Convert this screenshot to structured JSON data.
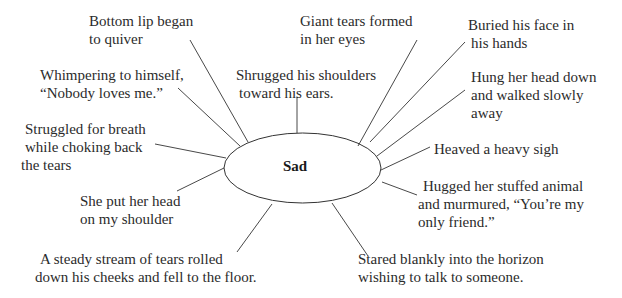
{
  "diagram": {
    "type": "spider-web / word web",
    "center": {
      "label": "Sad"
    },
    "branches": [
      {
        "id": "bottom-lip",
        "lines": [
          "Bottom lip began",
          "to quiver"
        ]
      },
      {
        "id": "giant-tears",
        "lines": [
          "Giant tears formed",
          "in her eyes"
        ]
      },
      {
        "id": "buried-face",
        "lines": [
          "Buried his face in",
          "his hands"
        ]
      },
      {
        "id": "whimpering",
        "lines": [
          "Whimpering to himself,",
          "“Nobody loves me.”"
        ]
      },
      {
        "id": "shrugged",
        "lines": [
          "Shrugged his shoulders",
          "toward his ears."
        ]
      },
      {
        "id": "hung-head",
        "lines": [
          "Hung her head down",
          "and walked slowly",
          "away"
        ]
      },
      {
        "id": "struggled",
        "lines": [
          "Struggled for breath",
          "while choking back",
          "the tears"
        ]
      },
      {
        "id": "heaved",
        "lines": [
          "Heaved a heavy sigh"
        ]
      },
      {
        "id": "hugged",
        "lines": [
          "Hugged her stuffed animal",
          "and murmured, “You’re my",
          "only friend.”"
        ]
      },
      {
        "id": "head-shoulder",
        "lines": [
          "She put her head",
          "on my shoulder"
        ]
      },
      {
        "id": "steady-stream",
        "lines": [
          "A steady stream of tears rolled",
          "down his cheeks and fell to the floor."
        ]
      },
      {
        "id": "stared",
        "lines": [
          "Stared blankly into the horizon",
          "wishing to talk to someone."
        ]
      }
    ]
  },
  "colors": {
    "background": "#ffffff",
    "text": "#2b2b2b",
    "lines": "#333333"
  }
}
